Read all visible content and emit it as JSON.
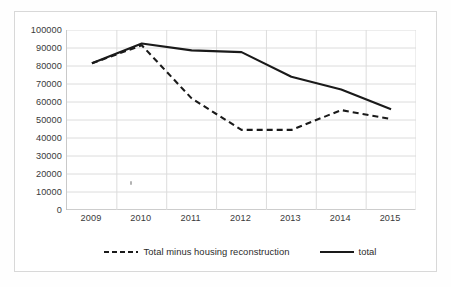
{
  "chart_data": {
    "type": "line",
    "title": "",
    "xlabel": "",
    "ylabel": "",
    "categories": [
      "2009",
      "2010",
      "2011",
      "2012",
      "2013",
      "2014",
      "2015"
    ],
    "ylim": [
      0,
      100000
    ],
    "ytick_step": 10000,
    "yticks": [
      "100000",
      "90000",
      "80000",
      "70000",
      "60000",
      "50000",
      "40000",
      "30000",
      "20000",
      "10000",
      "0"
    ],
    "ytick_values": [
      100000,
      90000,
      80000,
      70000,
      60000,
      50000,
      40000,
      30000,
      20000,
      10000,
      0
    ],
    "grid": "horizontal-and-vertical",
    "legend_position": "bottom",
    "series": [
      {
        "name": "Total minus housing reconstruction",
        "style": "dashed",
        "color": "#1a1a1a",
        "values": [
          81500,
          91500,
          62000,
          44500,
          44500,
          55500,
          50500
        ]
      },
      {
        "name": "total",
        "style": "solid",
        "color": "#1a1a1a",
        "values": [
          81500,
          92500,
          88700,
          87700,
          74000,
          67000,
          56000
        ]
      }
    ]
  },
  "legend": {
    "items": [
      {
        "label": "Total minus housing reconstruction",
        "style": "dashed"
      },
      {
        "label": "total",
        "style": "solid"
      }
    ]
  },
  "colors": {
    "series_line": "#1a1a1a",
    "grid": "#dcdcdc",
    "axis": "#bdbdbd",
    "tick_text": "#3a3a3a",
    "frame": "#d8d8d8",
    "background": "#ffffff"
  }
}
